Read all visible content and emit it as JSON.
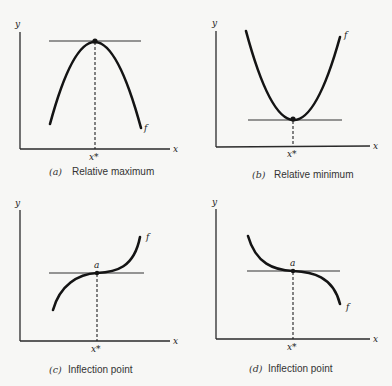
{
  "figure": {
    "panels": [
      {
        "id": "a",
        "tag": "(a)",
        "caption": "Relative maximum",
        "y_axis_label": "y",
        "x_axis_label": "x",
        "critical_point_label": "x*",
        "function_label": "f",
        "point_label": ""
      },
      {
        "id": "b",
        "tag": "(b)",
        "caption": "Relative minimum",
        "y_axis_label": "y",
        "x_axis_label": "x",
        "critical_point_label": "x*",
        "function_label": "f",
        "point_label": ""
      },
      {
        "id": "c",
        "tag": "(c)",
        "caption": "Inflection point",
        "y_axis_label": "y",
        "x_axis_label": "x",
        "critical_point_label": "x*",
        "function_label": "f",
        "point_label": "a"
      },
      {
        "id": "d",
        "tag": "(d)",
        "caption": "Inflection point",
        "y_axis_label": "y",
        "x_axis_label": "x",
        "critical_point_label": "x*",
        "function_label": "f",
        "point_label": "a"
      }
    ]
  }
}
